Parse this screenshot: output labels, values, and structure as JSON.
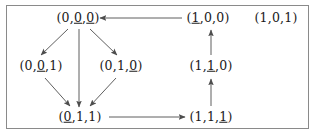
{
  "figure": {
    "border_color": "#8a8a8a",
    "background_color": "#ffffff",
    "text_color": "#1a1a1a",
    "edge_color": "#4d4d4d"
  },
  "nodes": [
    {
      "id": "n000",
      "name": "node-0-0u-0u",
      "label": "(0,0,0)",
      "digits": [
        "0",
        "0",
        "0"
      ],
      "underlined": [
        false,
        true,
        true
      ],
      "x": 78,
      "y": 18
    },
    {
      "id": "n100",
      "name": "node-1u-0-0",
      "label": "(1,0,0)",
      "digits": [
        "1",
        "0",
        "0"
      ],
      "underlined": [
        true,
        false,
        false
      ],
      "x": 208,
      "y": 18
    },
    {
      "id": "n101",
      "name": "node-1-0-1",
      "label": "(1,0,1)",
      "digits": [
        "1",
        "0",
        "1"
      ],
      "underlined": [
        false,
        false,
        false
      ],
      "x": 276,
      "y": 18
    },
    {
      "id": "n001",
      "name": "node-0-0u-1",
      "label": "(0,0,1)",
      "digits": [
        "0",
        "0",
        "1"
      ],
      "underlined": [
        false,
        true,
        false
      ],
      "x": 41,
      "y": 66
    },
    {
      "id": "n010",
      "name": "node-0-1-0u",
      "label": "(0,1,0)",
      "digits": [
        "0",
        "1",
        "0"
      ],
      "underlined": [
        false,
        false,
        true
      ],
      "x": 121,
      "y": 66
    },
    {
      "id": "n110",
      "name": "node-1-1u-0",
      "label": "(1,1,0)",
      "digits": [
        "1",
        "1",
        "0"
      ],
      "underlined": [
        false,
        true,
        false
      ],
      "x": 211,
      "y": 66
    },
    {
      "id": "n011",
      "name": "node-0u-1-1",
      "label": "(0,1,1)",
      "digits": [
        "0",
        "1",
        "1"
      ],
      "underlined": [
        true,
        false,
        false
      ],
      "x": 80,
      "y": 117
    },
    {
      "id": "n111",
      "name": "node-1-1-1u",
      "label": "(1,1,1)",
      "digits": [
        "1",
        "1",
        "1"
      ],
      "underlined": [
        false,
        false,
        true
      ],
      "x": 211,
      "y": 117
    }
  ],
  "edges": [
    {
      "name": "edge-100-to-000",
      "from": "n100",
      "to": "n000",
      "direction": "left",
      "x1": 182,
      "y1": 18,
      "x2": 100,
      "y2": 18
    },
    {
      "name": "edge-000-to-001",
      "from": "n000",
      "to": "n001",
      "direction": "down-left",
      "x1": 68,
      "y1": 29,
      "x2": 41,
      "y2": 55
    },
    {
      "name": "edge-000-to-010",
      "from": "n000",
      "to": "n010",
      "direction": "down-right",
      "x1": 90,
      "y1": 29,
      "x2": 117,
      "y2": 55
    },
    {
      "name": "edge-000-to-011",
      "from": "n000",
      "to": "n011",
      "direction": "down",
      "x1": 79,
      "y1": 29,
      "x2": 79,
      "y2": 107
    },
    {
      "name": "edge-001-to-011",
      "from": "n001",
      "to": "n011",
      "direction": "down-right",
      "x1": 45,
      "y1": 78,
      "x2": 70,
      "y2": 106
    },
    {
      "name": "edge-010-to-011",
      "from": "n010",
      "to": "n011",
      "direction": "down-left",
      "x1": 116,
      "y1": 78,
      "x2": 90,
      "y2": 106
    },
    {
      "name": "edge-011-to-111",
      "from": "n011",
      "to": "n111",
      "direction": "right",
      "x1": 109,
      "y1": 117,
      "x2": 185,
      "y2": 117
    },
    {
      "name": "edge-111-to-110",
      "from": "n111",
      "to": "n110",
      "direction": "up",
      "x1": 211,
      "y1": 106,
      "x2": 211,
      "y2": 79
    },
    {
      "name": "edge-110-to-100",
      "from": "n110",
      "to": "n100",
      "direction": "up",
      "x1": 211,
      "y1": 55,
      "x2": 211,
      "y2": 30
    }
  ]
}
